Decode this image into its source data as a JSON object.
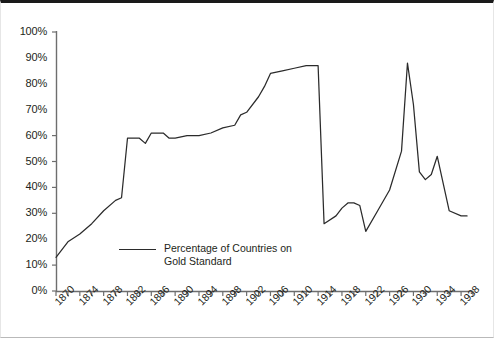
{
  "chart_data": {
    "type": "line",
    "title": "",
    "xlabel": "",
    "ylabel": "",
    "xlim": [
      1870,
      1940
    ],
    "ylim": [
      0,
      100
    ],
    "grid": false,
    "legend_position": "inside-bottom-left",
    "y_ticks": [
      "0%",
      "10%",
      "20%",
      "30%",
      "40%",
      "50%",
      "60%",
      "70%",
      "80%",
      "90%",
      "100%"
    ],
    "y_tick_values": [
      0,
      10,
      20,
      30,
      40,
      50,
      60,
      70,
      80,
      90,
      100
    ],
    "x_ticks": [
      "1870",
      "1874",
      "1878",
      "1882",
      "1886",
      "1890",
      "1894",
      "1898",
      "1902",
      "1906",
      "1910",
      "1914",
      "1918",
      "1922",
      "1926",
      "1930",
      "1934",
      "1938"
    ],
    "x_tick_values": [
      1870,
      1874,
      1878,
      1882,
      1886,
      1890,
      1894,
      1898,
      1902,
      1906,
      1910,
      1914,
      1918,
      1922,
      1926,
      1930,
      1934,
      1938
    ],
    "x_minor_tick_step": 2,
    "series": [
      {
        "name": "Percentage of Countries on Gold Standard",
        "color": "#2b2b2b",
        "x": [
          1870,
          1872,
          1874,
          1876,
          1878,
          1880,
          1881,
          1882,
          1884,
          1885,
          1886,
          1888,
          1889,
          1890,
          1892,
          1894,
          1896,
          1898,
          1900,
          1901,
          1902,
          1904,
          1905,
          1906,
          1908,
          1910,
          1912,
          1913,
          1914,
          1915,
          1917,
          1918,
          1919,
          1920,
          1921,
          1922,
          1924,
          1926,
          1928,
          1929,
          1930,
          1931,
          1932,
          1933,
          1934,
          1936,
          1938,
          1939
        ],
        "y": [
          13,
          19,
          22,
          26,
          31,
          35,
          36,
          59,
          59,
          57,
          61,
          61,
          59,
          59,
          60,
          60,
          61,
          63,
          64,
          68,
          69,
          75,
          79,
          84,
          85,
          86,
          87,
          87,
          87,
          26,
          29,
          32,
          34,
          34,
          33,
          23,
          31,
          39,
          54,
          88,
          72,
          46,
          43,
          45,
          52,
          31,
          29,
          29
        ]
      }
    ]
  },
  "legend": {
    "label": "Percentage of Countries on\nGold Standard"
  },
  "axes": {
    "y_axis_name": "percentage-axis",
    "x_axis_name": "year-axis"
  }
}
